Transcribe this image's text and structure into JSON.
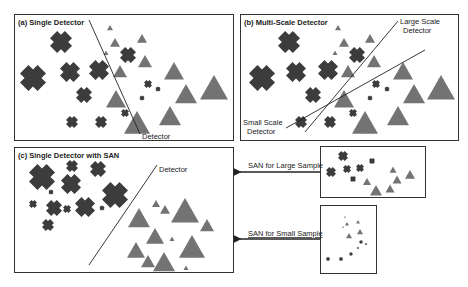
{
  "colors": {
    "cross": "#3c3c3c",
    "triangle": "#737373",
    "border": "#333333",
    "line": "#222222"
  },
  "panels": {
    "a": {
      "title": "(a) Single Detector",
      "detector_label": "Detector"
    },
    "b": {
      "title": "(b) Multi-Scale Detector",
      "large_label_1": "Large Scale",
      "large_label_2": "Detector",
      "small_label_1": "Small Scale",
      "small_label_2": "Detector"
    },
    "c": {
      "title": "(c) Single Detector with SAN",
      "detector_label": "Detector"
    }
  },
  "arrows": {
    "large": "SAN for Large Sample",
    "small": "SAN for Small Sample"
  }
}
